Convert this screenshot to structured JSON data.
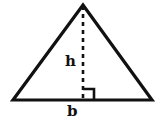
{
  "figure": {
    "kind": "geometry-diagram",
    "shape": "triangle",
    "background_color": "#ffffff",
    "stroke_color": "#111111"
  },
  "labels": {
    "height": "h",
    "base": "b"
  },
  "geometry": {
    "apex": {
      "x": 83,
      "y": 5
    },
    "base_left": {
      "x": 13,
      "y": 100
    },
    "base_right": {
      "x": 152,
      "y": 100
    },
    "height_foot": {
      "x": 83,
      "y": 100
    },
    "outline_stroke_width": 3.2,
    "dash_stroke_width": 2.6,
    "dash_pattern": "4 4",
    "right_angle_marker": {
      "size": 11,
      "stroke_width": 2.6,
      "corner": {
        "x": 83,
        "y": 100
      },
      "side": "right"
    }
  }
}
